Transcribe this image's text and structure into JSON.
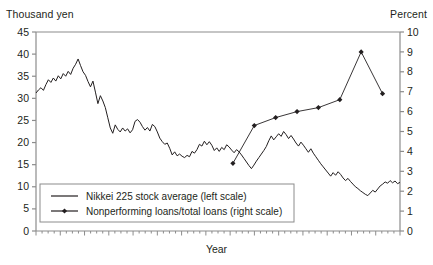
{
  "figure": {
    "left_axis_unit": "Thousand yen",
    "right_axis_unit": "Percent",
    "xaxis_title": "Year"
  },
  "legend": {
    "items": [
      {
        "label": "Nikkei 225 stock average (left scale)",
        "marker": "line"
      },
      {
        "label": "Nonperforming loans/total loans (right scale)",
        "marker": "line-with-diamond"
      }
    ]
  },
  "chart_data": {
    "type": "line",
    "title": "",
    "xlabel": "Year",
    "ylabel": "Thousand yen",
    "y2label": "Percent",
    "ylim": [
      0,
      45
    ],
    "y2lim": [
      0,
      10
    ],
    "grid": false,
    "legend_position": "lower-left-inside",
    "left_ticks": [
      0,
      5,
      10,
      15,
      20,
      25,
      30,
      35,
      40,
      45
    ],
    "right_ticks": [
      0,
      1,
      2,
      3,
      4,
      5,
      6,
      7,
      8,
      9,
      10
    ],
    "xtick_count": 60,
    "xtick_labels": [],
    "series": [
      {
        "name": "Nikkei 225 stock average (left scale)",
        "axis": "left",
        "unit": "Thousand yen",
        "style": "solid-line",
        "color": "#231f20",
        "values": [
          31.2,
          31.9,
          32.4,
          31.8,
          33.1,
          34.2,
          33.6,
          34.6,
          33.9,
          35.1,
          34.4,
          35.6,
          35.0,
          36.1,
          35.4,
          36.8,
          37.7,
          38.9,
          37.4,
          36.0,
          35.2,
          33.8,
          32.6,
          33.9,
          31.4,
          28.8,
          30.6,
          29.4,
          27.9,
          25.6,
          23.3,
          22.1,
          24.0,
          23.0,
          22.4,
          23.3,
          22.6,
          23.1,
          22.2,
          22.9,
          24.8,
          25.2,
          24.6,
          23.6,
          22.8,
          23.4,
          22.6,
          24.1,
          23.6,
          22.4,
          21.0,
          20.2,
          19.6,
          19.9,
          18.7,
          17.2,
          17.9,
          17.0,
          17.4,
          16.9,
          16.6,
          17.1,
          16.8,
          18.0,
          17.6,
          18.4,
          19.6,
          19.2,
          20.3,
          19.5,
          20.2,
          19.4,
          18.2,
          18.8,
          18.0,
          18.9,
          18.4,
          19.5,
          19.0,
          18.3,
          17.7,
          18.4,
          17.9,
          17.2,
          16.4,
          15.6,
          14.8,
          14.1,
          14.9,
          15.8,
          16.6,
          17.4,
          18.2,
          19.1,
          20.4,
          21.5,
          20.6,
          21.3,
          22.0,
          21.4,
          22.5,
          21.8,
          20.9,
          21.6,
          20.8,
          19.9,
          19.2,
          20.1,
          19.4,
          18.6,
          17.8,
          18.6,
          17.6,
          16.8,
          16.0,
          15.2,
          14.5,
          13.8,
          13.1,
          12.4,
          13.2,
          12.6,
          13.4,
          12.8,
          12.0,
          11.4,
          11.9,
          11.2,
          10.6,
          10.0,
          9.6,
          9.1,
          8.7,
          8.3,
          8.0,
          8.6,
          9.2,
          8.8,
          9.5,
          10.2,
          10.6,
          11.1,
          10.8,
          11.4,
          10.9,
          11.3,
          10.7,
          11.0
        ]
      },
      {
        "name": "Nonperforming loans/total loans (right scale)",
        "axis": "right",
        "unit": "Percent",
        "style": "line-with-diamond-markers",
        "color": "#231f20",
        "points": [
          {
            "x_index": 0,
            "value": 3.4
          },
          {
            "x_index": 1,
            "value": 5.3
          },
          {
            "x_index": 2,
            "value": 5.7
          },
          {
            "x_index": 3,
            "value": 6.0
          },
          {
            "x_index": 4,
            "value": 6.2
          },
          {
            "x_index": 5,
            "value": 6.6
          },
          {
            "x_index": 6,
            "value": 9.0
          },
          {
            "x_index": 7,
            "value": 6.9
          }
        ]
      }
    ]
  }
}
